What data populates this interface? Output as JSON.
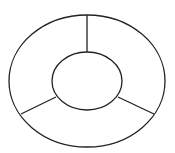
{
  "diagram": {
    "type": "segmented-ring",
    "stroke_color": "#222222",
    "background": "#ffffff",
    "outer_ellipse": {
      "cx": 87,
      "cy": 81,
      "rx": 78,
      "ry": 66
    },
    "inner_ellipse": {
      "cx": 87,
      "cy": 81,
      "rx": 35,
      "ry": 29
    },
    "segments": 3,
    "dividers": [
      {
        "x1": 87,
        "y1": 15,
        "x2": 87,
        "y2": 52
      },
      {
        "x1": 56,
        "y1": 97,
        "x2": 21,
        "y2": 114
      },
      {
        "x1": 118,
        "y1": 97,
        "x2": 154,
        "y2": 114
      }
    ]
  }
}
